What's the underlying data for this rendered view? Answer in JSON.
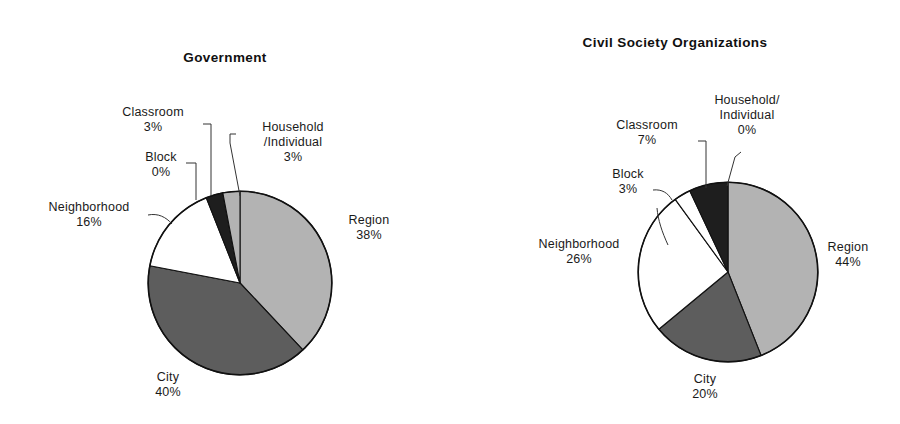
{
  "figure": {
    "background_color": "#ffffff",
    "panels": [
      "Government",
      "Civil Society Organizations"
    ]
  },
  "palette": {
    "region_fill": "#b3b3b3",
    "city_fill": "#5d5d5d",
    "neighborhood_fill": "#ffffff",
    "block_fill": "#ffffff",
    "classroom_fill": "#1e1e1e",
    "household_fill": "#b3b3b3",
    "outline": "#111111",
    "text": "#1a1a1a"
  },
  "government": {
    "title": "Government",
    "labels": {
      "classroom": {
        "name": "Classroom",
        "value": "3%"
      },
      "block": {
        "name": "Block",
        "value": "0%"
      },
      "neighborhood": {
        "name": "Neighborhood",
        "value": "16%"
      },
      "household_line1": "Household",
      "household_line2": "/Individual",
      "household_value": "3%",
      "region": {
        "name": "Region",
        "value": "38%"
      },
      "city": {
        "name": "City",
        "value": "40%"
      }
    }
  },
  "civil": {
    "title": "Civil Society Organizations",
    "labels": {
      "classroom": {
        "name": "Classroom",
        "value": "7%"
      },
      "block": {
        "name": "Block",
        "value": "3%"
      },
      "neighborhood": {
        "name": "Neighborhood",
        "value": "26%"
      },
      "household_line1": "Household/",
      "household_line2": "Individual",
      "household_value": "0%",
      "region": {
        "name": "Region",
        "value": "44%"
      },
      "city": {
        "name": "City",
        "value": "20%"
      }
    }
  },
  "chart_data": [
    {
      "type": "pie",
      "title": "Government",
      "categories": [
        "Region",
        "City",
        "Neighborhood",
        "Block",
        "Classroom",
        "Household/Individual"
      ],
      "values": [
        38,
        40,
        16,
        0,
        3,
        3
      ],
      "value_labels": [
        "38%",
        "40%",
        "16%",
        "0%",
        "3%",
        "3%"
      ],
      "colors": [
        "#b3b3b3",
        "#5d5d5d",
        "#ffffff",
        "#ffffff",
        "#1e1e1e",
        "#b3b3b3"
      ],
      "start_angle_deg": 0,
      "direction": "clockwise",
      "legend": "none",
      "labels_position": "outside-with-leader-lines",
      "units": "percent"
    },
    {
      "type": "pie",
      "title": "Civil Society Organizations",
      "categories": [
        "Region",
        "City",
        "Neighborhood",
        "Block",
        "Classroom",
        "Household/Individual"
      ],
      "values": [
        44,
        20,
        26,
        3,
        7,
        0
      ],
      "value_labels": [
        "44%",
        "20%",
        "26%",
        "3%",
        "7%",
        "0%"
      ],
      "colors": [
        "#b3b3b3",
        "#5d5d5d",
        "#ffffff",
        "#ffffff",
        "#1e1e1e",
        "#b3b3b3"
      ],
      "start_angle_deg": 0,
      "direction": "clockwise",
      "legend": "none",
      "labels_position": "outside-with-leader-lines",
      "units": "percent"
    }
  ]
}
